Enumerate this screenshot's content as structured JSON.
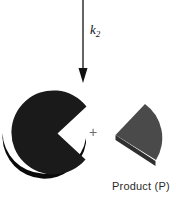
{
  "figure": {
    "background_color": "#ffffff",
    "width": 176,
    "height": 199,
    "type": "reaction-scheme-diagram"
  },
  "arrow": {
    "name": "reaction-arrow",
    "direction": "down",
    "color": "#111111",
    "shaft_top_y": 0,
    "tip_y": 82,
    "x": 83
  },
  "rate_constant": {
    "symbol": "k",
    "subscript": "2",
    "full_label": "k2",
    "color": "#111111"
  },
  "substrate": {
    "name": "substrate-pacman-shape",
    "fill_color": "#1a1a1a",
    "edge_color": "#0a0a0a",
    "description": "near-black disc with wedge mouth open to the right"
  },
  "plus": {
    "label": "+",
    "color": "#6d6d6d"
  },
  "product": {
    "name": "product-wedge-shape",
    "fill_color": "#4a4a4a",
    "edge_color": "#333333",
    "caption": "Product (P)",
    "caption_color": "#2b2b2b"
  }
}
